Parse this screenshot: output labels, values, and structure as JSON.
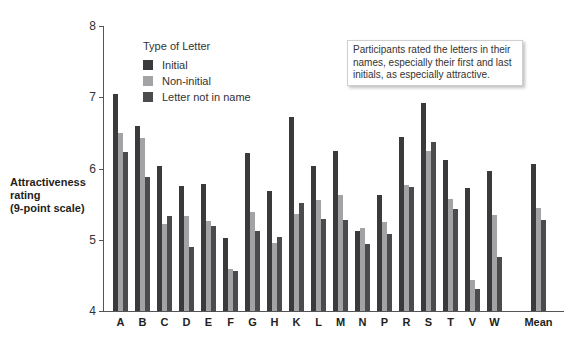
{
  "chart_data": {
    "type": "bar",
    "title": "",
    "xlabel": "",
    "ylabel": "Attractiveness rating (9-point scale)",
    "ylabel_lines": [
      "Attractiveness",
      "rating",
      "(9-point scale)"
    ],
    "ylim": [
      4,
      8
    ],
    "yticks": [
      4,
      5,
      6,
      7,
      8
    ],
    "grid": false,
    "legend_title": "Type of Letter",
    "legend_position": "upper-left",
    "categories": [
      "A",
      "B",
      "C",
      "D",
      "E",
      "F",
      "G",
      "H",
      "K",
      "L",
      "M",
      "N",
      "P",
      "R",
      "S",
      "T",
      "V",
      "W",
      "Mean"
    ],
    "series": [
      {
        "name": "Initial",
        "color": "#3a3a3d",
        "values": [
          7.05,
          6.6,
          6.03,
          5.75,
          5.78,
          5.02,
          6.22,
          5.68,
          6.72,
          6.03,
          6.24,
          5.12,
          5.63,
          6.44,
          6.92,
          6.12,
          5.73,
          5.96,
          6.06
        ]
      },
      {
        "name": "Non-initial",
        "color": "#a3a3a5",
        "values": [
          6.5,
          6.43,
          5.22,
          5.33,
          5.26,
          4.59,
          5.39,
          4.95,
          5.36,
          5.56,
          5.63,
          5.16,
          5.25,
          5.77,
          6.25,
          5.57,
          4.43,
          5.35,
          5.44
        ]
      },
      {
        "name": "Letter not in name",
        "color": "#4b4b4e",
        "values": [
          6.23,
          5.88,
          5.33,
          4.9,
          5.2,
          4.56,
          5.12,
          5.04,
          5.51,
          5.29,
          5.28,
          4.94,
          5.08,
          5.74,
          6.37,
          5.43,
          4.31,
          4.76,
          5.28
        ]
      }
    ],
    "annotations": [
      "Participants rated the letters in their names, especially their first and last initials, as especially attractive."
    ]
  },
  "legend": {
    "title": "Type of Letter",
    "items": [
      {
        "label": "Initial",
        "color": "#3a3a3d"
      },
      {
        "label": "Non-initial",
        "color": "#a3a3a5"
      },
      {
        "label": "Letter not in name",
        "color": "#4b4b4e"
      }
    ]
  },
  "note": {
    "text": "Participants rated the letters in their names, especially their first and last initials, as especially attractive."
  },
  "axis": {
    "ylabel_lines": [
      "Attractiveness",
      "rating",
      "(9-point scale)"
    ],
    "yticks": [
      "8",
      "7",
      "6",
      "5",
      "4"
    ]
  }
}
